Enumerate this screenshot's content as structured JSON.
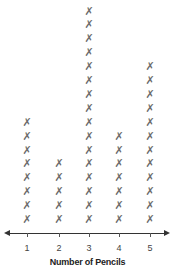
{
  "chart_data": {
    "type": "dot",
    "subtype": "line plot with x marks",
    "title": "",
    "xlabel": "Number of Pencils",
    "ylabel": "",
    "categories": [
      "1",
      "2",
      "3",
      "4",
      "5"
    ],
    "values": [
      8,
      5,
      16,
      7,
      12
    ],
    "marker": "✗",
    "grid": false,
    "legend": null,
    "axis": {
      "arrows": "both",
      "ticks": [
        1,
        2,
        3,
        4,
        5
      ]
    }
  },
  "layout": {
    "column_x": [
      27,
      59,
      89,
      119,
      150
    ],
    "baseline_y": 220,
    "mark_spacing": 13.9,
    "mark_color": "#6b6b6b"
  }
}
